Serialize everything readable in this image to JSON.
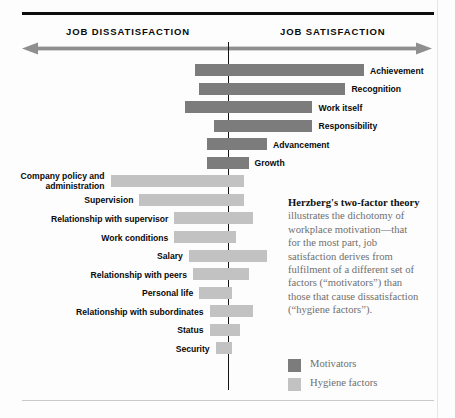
{
  "axis": {
    "left_heading": "JOB DISSATISFACTION",
    "right_heading": "JOB SATISFACTION",
    "arrow_icon": "double-headed-arrow-icon",
    "center_divider": "neutral-zero-line"
  },
  "note": {
    "lead": "Herzberg's two-factor theory",
    "body": " illustrates the dichotomy of workplace motivation—that for the most part, job satisfaction derives from fulfilment of a different set of factors (“motivators”) than those that cause dissatisfaction (“hygiene factors”)."
  },
  "legend": {
    "items": [
      {
        "label": "Motivators",
        "color": "#7c7c7c",
        "kind": "motivator"
      },
      {
        "label": "Hygiene factors",
        "color": "#c2c2c2",
        "kind": "hygiene"
      }
    ]
  },
  "colors": {
    "motivator": "#7c7c7c",
    "hygiene": "#c2c2c2",
    "rule": "#0d0d0d",
    "axis_arrow": "#8f8f8f",
    "center_line": "#131313"
  },
  "chart_data": {
    "type": "bar",
    "title": "Herzberg's two-factor theory",
    "orientation": "horizontal-diverging",
    "xlabel": "",
    "ylabel": "",
    "axis_left_label": "JOB DISSATISFACTION",
    "axis_right_label": "JOB SATISFACTION",
    "zero_at_px": 228,
    "xlim": [
      -100,
      100
    ],
    "grid": false,
    "legend_position": "right",
    "note": "Bars are floating ranges; 'left' is the extent into dissatisfaction, 'right' the extent into satisfaction, in percent of the axis half-width.",
    "series": [
      {
        "name": "Motivators",
        "color": "#7c7c7c",
        "bars": [
          {
            "label": "Achievement",
            "left": -16,
            "right": 66,
            "label_side": "right"
          },
          {
            "label": "Recognition",
            "left": -14,
            "right": 57,
            "label_side": "right"
          },
          {
            "label": "Work itself",
            "left": -21,
            "right": 41,
            "label_side": "right"
          },
          {
            "label": "Responsibility",
            "left": -7,
            "right": 41,
            "label_side": "right"
          },
          {
            "label": "Advancement",
            "left": -10,
            "right": 19,
            "label_side": "right"
          },
          {
            "label": "Growth",
            "left": -10,
            "right": 10,
            "label_side": "right"
          }
        ]
      },
      {
        "name": "Hygiene factors",
        "color": "#c2c2c2",
        "bars": [
          {
            "label": "Company policy and administration",
            "left": -57,
            "right": 8,
            "label_side": "left"
          },
          {
            "label": "Supervision",
            "left": -43,
            "right": 8,
            "label_side": "left"
          },
          {
            "label": "Relationship with supervisor",
            "left": -26,
            "right": 12,
            "label_side": "left"
          },
          {
            "label": "Work conditions",
            "left": -26,
            "right": 4,
            "label_side": "left"
          },
          {
            "label": "Salary",
            "left": -19,
            "right": 19,
            "label_side": "left"
          },
          {
            "label": "Relationship with peers",
            "left": -17,
            "right": 10,
            "label_side": "left"
          },
          {
            "label": "Personal life",
            "left": -14,
            "right": 2,
            "label_side": "left"
          },
          {
            "label": "Relationship with subordinates",
            "left": -9,
            "right": 12,
            "label_side": "left"
          },
          {
            "label": "Status",
            "left": -9,
            "right": 6,
            "label_side": "left"
          },
          {
            "label": "Security",
            "left": -6,
            "right": 2,
            "label_side": "left"
          }
        ]
      }
    ]
  }
}
